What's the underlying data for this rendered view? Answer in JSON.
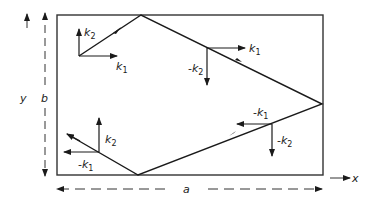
{
  "figure": {
    "type": "wave-reflection-in-rectangular-waveguide",
    "colors": {
      "ink": "#1a1a1a",
      "background": "#ffffff"
    }
  },
  "axes": {
    "y_label": "y",
    "b_label": "b",
    "x_label": "x",
    "a_label": "a"
  },
  "vectors": {
    "top_left": {
      "k2": "k",
      "k2_sub": "2",
      "k1": "k",
      "k1_sub": "1"
    },
    "upper_right": {
      "k1": "k",
      "k1_sub": "1",
      "neg_k2_prefix": "-",
      "neg_k2": "k",
      "neg_k2_sub": "2"
    },
    "lower_right": {
      "neg_k1_prefix": "-",
      "neg_k1": "k",
      "neg_k1_sub": "1",
      "neg_k2_prefix": "-",
      "neg_k2": "k",
      "neg_k2_sub": "2"
    },
    "lower_left": {
      "k2": "k",
      "k2_sub": "2",
      "neg_k1_prefix": "-",
      "neg_k1": "k",
      "neg_k1_sub": "1"
    }
  }
}
